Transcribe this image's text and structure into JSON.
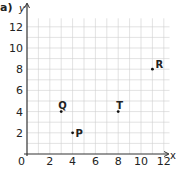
{
  "part_label": "a)",
  "chart_data": {
    "type": "scatter",
    "title": "",
    "xlabel": "x",
    "ylabel": "y",
    "xlim": [
      0,
      12
    ],
    "ylim": [
      0,
      12
    ],
    "grid": true,
    "x_ticks": [
      0,
      2,
      4,
      6,
      8,
      10,
      12
    ],
    "y_ticks": [
      2,
      4,
      6,
      8,
      10,
      12
    ],
    "origin_label": "0",
    "points": [
      {
        "label": "P",
        "x": 4,
        "y": 2
      },
      {
        "label": "Q",
        "x": 3,
        "y": 4
      },
      {
        "label": "T",
        "x": 8,
        "y": 4
      },
      {
        "label": "R",
        "x": 11,
        "y": 8
      }
    ]
  },
  "colors": {
    "grid": "#cfcfcf",
    "axis": "#333333",
    "point": "#111111"
  }
}
